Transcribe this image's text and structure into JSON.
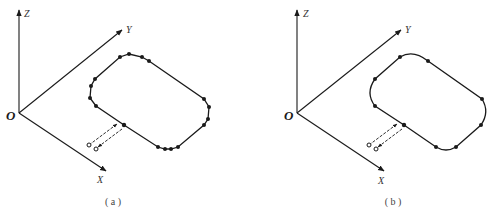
{
  "figure": {
    "panels": [
      {
        "id": "a",
        "caption": "( a )",
        "axes": {
          "x_label": "X",
          "y_label": "Y",
          "z_label": "Z",
          "origin_label": "O"
        },
        "path_type": "densely sampled teach points (polyline approximation of arcs)",
        "point_count": 17
      },
      {
        "id": "b",
        "caption": "( b )",
        "axes": {
          "x_label": "X",
          "y_label": "Y",
          "z_label": "Z",
          "origin_label": "O"
        },
        "path_type": "sparse teach points with circular arc interpolation",
        "point_count": 9
      }
    ]
  }
}
